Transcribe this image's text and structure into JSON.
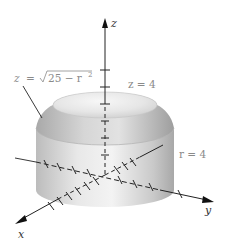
{
  "figure": {
    "type": "3d-solid-diagram",
    "colors": {
      "background": "#ffffff",
      "axis": "#222222",
      "solid_light": "#f2f2f2",
      "solid_mid": "#d4d4d4",
      "solid_dark": "#a9a9a9",
      "label_gray": "#8a8a8a"
    },
    "axes": {
      "x": {
        "label": "x"
      },
      "y": {
        "label": "y"
      },
      "z": {
        "label": "z"
      }
    },
    "annotations": {
      "sphere_surface": {
        "lhs": "z",
        "eq": "=",
        "radicand": "25 − r",
        "exp": "2"
      },
      "plane": {
        "text": "z = 4"
      },
      "cylinder": {
        "text": "r = 4"
      }
    }
  }
}
